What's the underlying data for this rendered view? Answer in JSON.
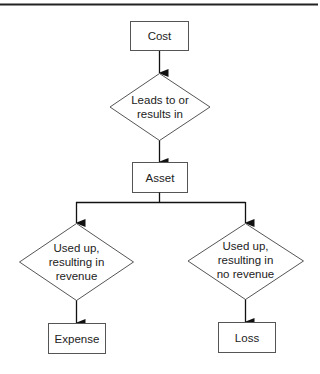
{
  "diagram": {
    "type": "flowchart",
    "nodes": {
      "cost": {
        "shape": "rectangle",
        "label": "Cost"
      },
      "leads_to": {
        "shape": "diamond",
        "label_lines": [
          "Leads to or",
          "results in"
        ]
      },
      "asset": {
        "shape": "rectangle",
        "label": "Asset"
      },
      "used_revenue": {
        "shape": "diamond",
        "label_lines": [
          "Used up,",
          "resulting in",
          "revenue"
        ]
      },
      "used_no_revenue": {
        "shape": "diamond",
        "label_lines": [
          "Used up,",
          "resulting in",
          "no revenue"
        ]
      },
      "expense": {
        "shape": "rectangle",
        "label": "Expense"
      },
      "loss": {
        "shape": "rectangle",
        "label": "Loss"
      }
    },
    "edges": [
      {
        "from": "cost",
        "to": "leads_to"
      },
      {
        "from": "leads_to",
        "to": "asset"
      },
      {
        "from": "asset",
        "to": "used_revenue"
      },
      {
        "from": "asset",
        "to": "used_no_revenue"
      },
      {
        "from": "used_revenue",
        "to": "expense"
      },
      {
        "from": "used_no_revenue",
        "to": "loss"
      }
    ],
    "colors": {
      "stroke": "#555555",
      "arrow": "#111111",
      "rule": "#222222"
    }
  }
}
